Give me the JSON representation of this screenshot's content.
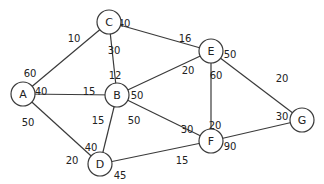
{
  "graph": {
    "nodes": [
      {
        "id": "A",
        "label": "A",
        "x": 23,
        "y": 94
      },
      {
        "id": "B",
        "label": "B",
        "x": 117,
        "y": 95
      },
      {
        "id": "C",
        "label": "C",
        "x": 109,
        "y": 22
      },
      {
        "id": "D",
        "label": "D",
        "x": 100,
        "y": 164
      },
      {
        "id": "E",
        "label": "E",
        "x": 211,
        "y": 51
      },
      {
        "id": "F",
        "label": "F",
        "x": 211,
        "y": 141
      },
      {
        "id": "G",
        "label": "G",
        "x": 302,
        "y": 120
      }
    ],
    "node_radius": 12,
    "edges": [
      {
        "from": "A",
        "to": "C",
        "w_from": "60",
        "w_to": "10",
        "lf": [
          30,
          73
        ],
        "lt": [
          74,
          38
        ]
      },
      {
        "from": "A",
        "to": "B",
        "w_from": "40",
        "w_to": "15",
        "lf": [
          41,
          91
        ],
        "lt": [
          89,
          91
        ]
      },
      {
        "from": "A",
        "to": "D",
        "w_from": "50",
        "w_to": "20",
        "lf": [
          28,
          122
        ],
        "lt": [
          72,
          160
        ]
      },
      {
        "from": "C",
        "to": "B",
        "w_from": "30",
        "w_to": "12",
        "lf": [
          114,
          50
        ],
        "lt": [
          115,
          75
        ]
      },
      {
        "from": "C",
        "to": "E",
        "w_from": "40",
        "w_to": "16",
        "lf": [
          124,
          23
        ],
        "lt": [
          185,
          38
        ]
      },
      {
        "from": "B",
        "to": "E",
        "w_from": "50",
        "w_to": "20",
        "lf": [
          137,
          95
        ],
        "lt": [
          188,
          70
        ]
      },
      {
        "from": "B",
        "to": "D",
        "w_from": "15",
        "w_to": "40",
        "lf": [
          98,
          120
        ],
        "lt": [
          91,
          147
        ]
      },
      {
        "from": "B",
        "to": "F",
        "w_from": "50",
        "w_to": "30",
        "lf": [
          134,
          120
        ],
        "lt": [
          187,
          129
        ]
      },
      {
        "from": "E",
        "to": "F",
        "w_from": "60",
        "w_to": "20",
        "lf": [
          216,
          75
        ],
        "lt": [
          215,
          125
        ]
      },
      {
        "from": "E",
        "to": "G",
        "w_from": "50",
        "w_to": "20",
        "lf": [
          230,
          54
        ],
        "lt": [
          282,
          78
        ]
      },
      {
        "from": "D",
        "to": "F",
        "w_from": "45",
        "w_to": "15",
        "lf": [
          120,
          175
        ],
        "lt": [
          182,
          160
        ]
      },
      {
        "from": "F",
        "to": "G",
        "w_from": "90",
        "w_to": "30",
        "lf": [
          230,
          146
        ],
        "lt": [
          282,
          116
        ]
      }
    ]
  }
}
